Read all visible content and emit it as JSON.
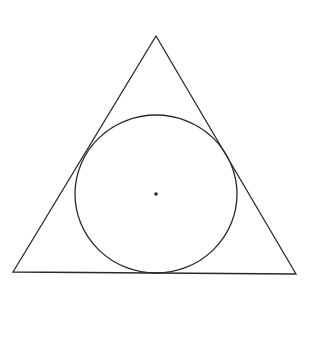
{
  "diagram": {
    "type": "geometric-figure",
    "background": "#ffffff",
    "stroke_color": "#2a2a2a",
    "triangle": {
      "apex": [
        156,
        36
      ],
      "bottom_left": [
        13,
        272
      ],
      "bottom_right": [
        296,
        274
      ]
    },
    "incircle": {
      "center": [
        156,
        194
      ],
      "rx": 81,
      "ry": 79
    },
    "center_point": {
      "position": [
        156,
        194
      ],
      "radius": 1.8
    }
  }
}
